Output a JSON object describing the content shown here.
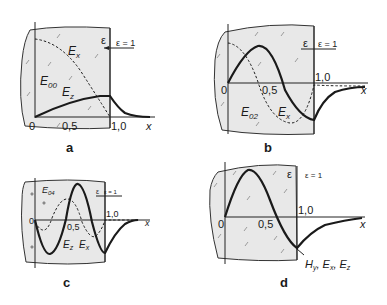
{
  "figure": {
    "panels": [
      {
        "id": "a",
        "letter": "a",
        "mode": "E00",
        "mode_label": "E",
        "mode_sub": "00",
        "curve_labels": [
          {
            "main": "E",
            "sub": "x"
          },
          {
            "main": "E",
            "sub": "z"
          }
        ],
        "eps_label": "ε",
        "eps1_label": "ε = 1",
        "tick_labels": {
          "origin": "0",
          "half": "0,5",
          "one": "1,0",
          "xaxis": "x"
        }
      },
      {
        "id": "b",
        "letter": "b",
        "mode": "E02",
        "mode_label": "E",
        "mode_sub": "02",
        "curve_labels": [
          {
            "main": "E",
            "sub": "x"
          }
        ],
        "eps_label": "ε",
        "eps1_label": "ε = 1",
        "tick_labels": {
          "origin": "0",
          "half": "0,5",
          "one": "1,0",
          "xaxis": "x"
        }
      },
      {
        "id": "c",
        "letter": "c",
        "mode": "E04",
        "mode_label": "E",
        "mode_sub": "04",
        "curve_labels": [
          {
            "main": "E",
            "sub": "z"
          },
          {
            "main": "E",
            "sub": "x"
          }
        ],
        "eps_label": "ε",
        "eps1_label": "ε = 1",
        "tick_labels": {
          "origin": "0",
          "half": "0,5",
          "one": "1,0",
          "xaxis": "x"
        }
      },
      {
        "id": "d",
        "letter": "d",
        "curve_labels": [
          {
            "main": "H",
            "sub": "y"
          },
          {
            "main": "E",
            "sub": "x"
          },
          {
            "main": "E",
            "sub": "z"
          }
        ],
        "curve_label_text": "Hy, Ex, Ez",
        "eps_label": "ε",
        "eps1_label": "ε = 1",
        "tick_labels": {
          "origin": "0",
          "half": "0,5",
          "one": "1,0",
          "xaxis": "x"
        }
      }
    ]
  }
}
